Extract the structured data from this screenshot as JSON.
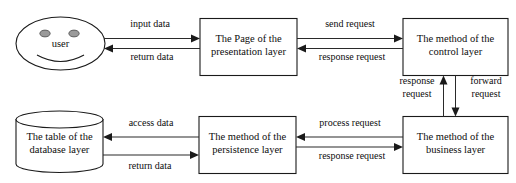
{
  "diagram": {
    "type": "flow-diagram",
    "background_color": "#ffffff",
    "line_color": "#2a2a2a",
    "text_color": "#0d0d0d",
    "nodes": {
      "user": {
        "label": "user",
        "shape": "smiley-face-ellipse"
      },
      "presentation": {
        "line1": "The Page of the",
        "line2": "presentation layer",
        "shape": "rectangle"
      },
      "control": {
        "line1": "The method of the",
        "line2": "control layer",
        "shape": "rectangle"
      },
      "database": {
        "line1": "The table of the",
        "line2": "database layer",
        "shape": "cylinder"
      },
      "persistence": {
        "line1": "The method of the",
        "line2": "persistence layer",
        "shape": "rectangle"
      },
      "business": {
        "line1": "The method of the",
        "line2": "business layer",
        "shape": "rectangle"
      }
    },
    "edges": {
      "input_data": {
        "label": "input data",
        "from": "user",
        "to": "presentation",
        "direction": "right"
      },
      "return_data_top": {
        "label": "return data",
        "from": "presentation",
        "to": "user",
        "direction": "left"
      },
      "send_request": {
        "label": "send request",
        "from": "presentation",
        "to": "control",
        "direction": "right"
      },
      "response_request_top": {
        "label": "response request",
        "from": "control",
        "to": "presentation",
        "direction": "left"
      },
      "response_request_vertical": {
        "label_line1": "response",
        "label_line2": "request",
        "from": "business",
        "to": "control",
        "direction": "up"
      },
      "forward_request_vertical": {
        "label_line1": "forward",
        "label_line2": "request",
        "from": "control",
        "to": "business",
        "direction": "down"
      },
      "process_request": {
        "label": "process request",
        "from": "business",
        "to": "persistence",
        "direction": "left"
      },
      "response_request_bottom": {
        "label": "response request",
        "from": "persistence",
        "to": "business",
        "direction": "right"
      },
      "access_data": {
        "label": "access data",
        "from": "persistence",
        "to": "database",
        "direction": "left"
      },
      "return_data_bottom": {
        "label": "return data",
        "from": "database",
        "to": "persistence",
        "direction": "right"
      }
    }
  }
}
